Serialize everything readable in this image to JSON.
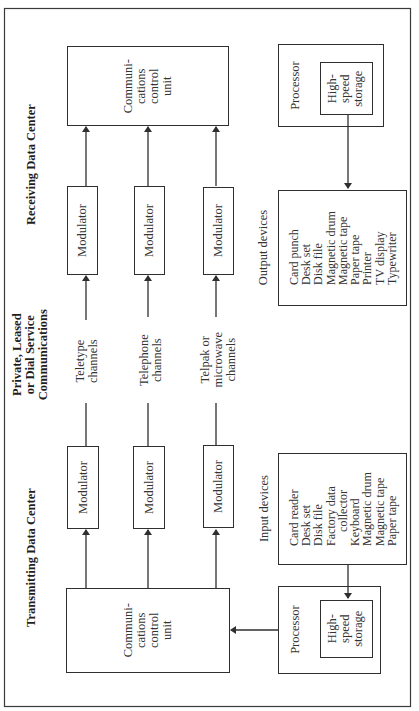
{
  "diagram": {
    "receiving": {
      "heading": "Receiving Data Center",
      "ccu": [
        "Communi-",
        "cations",
        "control",
        "unit"
      ],
      "modulators": [
        "Modulator",
        "Modulator",
        "Modulator"
      ],
      "processor": {
        "label": "Processor",
        "storage": [
          "High-",
          "speed",
          "storage"
        ]
      },
      "output_devices": {
        "title": "Output devices",
        "items": [
          "Card punch",
          "Desk set",
          "Disk file",
          "Magnetic drum",
          "Magnetic tape",
          "Paper tape",
          "Printer",
          "TV display",
          "Typewriter"
        ]
      }
    },
    "communications": {
      "heading": [
        "Private, Leased",
        "or Dial Service",
        "Communications"
      ],
      "channels": [
        [
          "Teletype",
          "channels"
        ],
        [
          "Telephone",
          "channels"
        ],
        [
          "Telpak or",
          "microwave",
          "channels"
        ]
      ]
    },
    "transmitting": {
      "heading": "Transmitting Data Center",
      "ccu": [
        "Communi-",
        "cations",
        "control",
        "unit"
      ],
      "modulators": [
        "Modulator",
        "Modulator",
        "Modulator"
      ],
      "processor": {
        "label": "Processor",
        "storage": [
          "High-",
          "speed",
          "storage"
        ]
      },
      "input_devices": {
        "title": "Input devices",
        "items": [
          "Card reader",
          "Desk set",
          "Disk file",
          "Factory data",
          "collector",
          "Keyboard",
          "Magnetic drum",
          "Magnetic tape",
          "Paper tape"
        ]
      }
    },
    "colors": {
      "ink": "#2f2f2f",
      "background": "#ffffff"
    }
  }
}
